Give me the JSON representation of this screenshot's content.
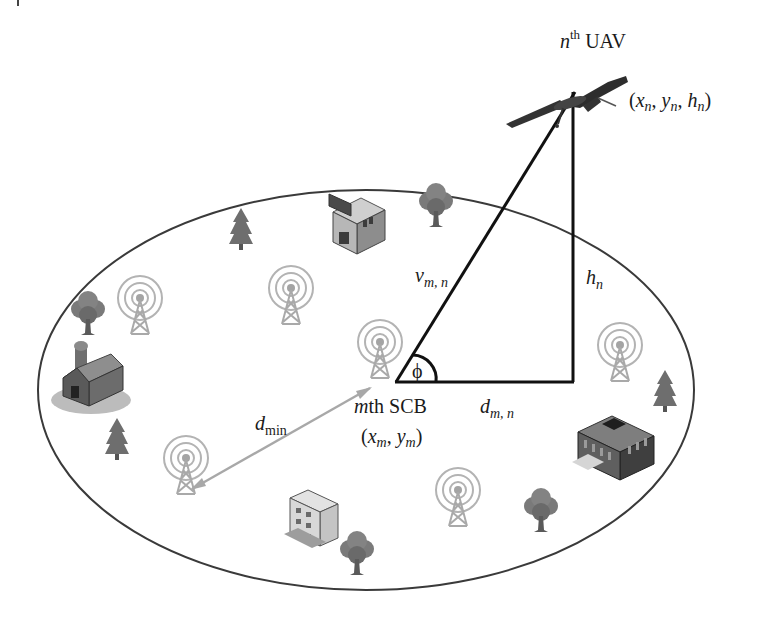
{
  "diagram": {
    "colors": {
      "background": "#ffffff",
      "ellipse_stroke": "#3a3a3a",
      "triangle_stroke": "#111111",
      "dmin_arrow": "#a8a8a8",
      "tower": "#a9a9a9",
      "tree": "#6e6e6e",
      "building_dark": "#3c3c3c",
      "building_light": "#cfcfcf"
    },
    "coverage_area": {
      "cx": 366,
      "cy": 390,
      "rx": 328,
      "ry": 200
    },
    "uav": {
      "label_prefix": "n",
      "label_sup": "th",
      "label_suffix": " UAV",
      "coord_label": "(x_n, y_n, h_n)",
      "coord_parts": {
        "open": "(",
        "x": "x",
        "x_sub": "n",
        "y": "y",
        "y_sub": "n",
        "h": "h",
        "h_sub": "n",
        "sep": ", ",
        "close": ")"
      },
      "position": [
        575,
        90
      ]
    },
    "scb": {
      "label_prefix": "m",
      "label_suffix": "th SCB",
      "coord_parts": {
        "open": "(",
        "x": "x",
        "x_sub": "m",
        "y": "y",
        "y_sub": "m",
        "sep": ", ",
        "close": ")"
      },
      "position": [
        396,
        382
      ]
    },
    "edges": {
      "slant": {
        "symbol": "v",
        "sub": "m, n"
      },
      "height": {
        "symbol": "h",
        "sub": "n"
      },
      "ground": {
        "symbol": "d",
        "sub": "m, n"
      },
      "min_distance": {
        "symbol": "d",
        "sub": "min"
      }
    },
    "angle": {
      "symbol": "ϕ"
    },
    "towers": [
      {
        "id": "tower-1",
        "x": 140,
        "y": 298
      },
      {
        "id": "tower-2",
        "x": 291,
        "y": 288
      },
      {
        "id": "tower-3",
        "x": 380,
        "y": 342
      },
      {
        "id": "tower-4",
        "x": 186,
        "y": 458
      },
      {
        "id": "tower-5",
        "x": 458,
        "y": 490
      },
      {
        "id": "tower-6",
        "x": 620,
        "y": 345
      }
    ],
    "trees": [
      {
        "id": "pine-1",
        "kind": "pine",
        "x": 241,
        "y": 228
      },
      {
        "id": "oak-1",
        "kind": "oak",
        "x": 88,
        "y": 313
      },
      {
        "id": "oak-2",
        "kind": "oak",
        "x": 436,
        "y": 205
      },
      {
        "id": "pine-2",
        "kind": "pine",
        "x": 117,
        "y": 438
      },
      {
        "id": "pine-3",
        "kind": "pine",
        "x": 665,
        "y": 390
      },
      {
        "id": "oak-3",
        "kind": "oak",
        "x": 541,
        "y": 510
      },
      {
        "id": "oak-4",
        "kind": "oak",
        "x": 357,
        "y": 553
      }
    ],
    "buildings": [
      {
        "id": "shop",
        "kind": "shop",
        "x": 355,
        "y": 228
      },
      {
        "id": "barn",
        "kind": "barn",
        "x": 85,
        "y": 378
      },
      {
        "id": "office",
        "kind": "office",
        "x": 618,
        "y": 450
      },
      {
        "id": "apartment",
        "kind": "apartment",
        "x": 318,
        "y": 520
      }
    ]
  }
}
